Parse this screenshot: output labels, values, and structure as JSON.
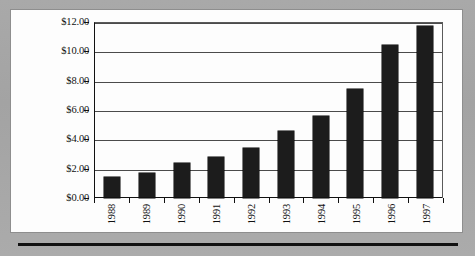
{
  "chart_data": {
    "type": "bar",
    "title": "",
    "xlabel": "",
    "ylabel": "",
    "categories": [
      "1988",
      "1989",
      "1990",
      "1991",
      "1992",
      "1993",
      "1994",
      "1995",
      "1996",
      "1997"
    ],
    "values": [
      1.4,
      1.7,
      2.4,
      2.8,
      3.4,
      4.6,
      5.6,
      7.4,
      10.4,
      11.7
    ],
    "ylim": [
      0,
      12
    ],
    "ytick_values": [
      0,
      2,
      4,
      6,
      8,
      10,
      12
    ],
    "ytick_labels": [
      "$0.00",
      "$2.00",
      "$4.00",
      "$6.00",
      "$8.00",
      "$10.00",
      "$12.00"
    ],
    "grid": true,
    "legend": "none",
    "bar_color": "#1c1c1c",
    "plot_background": "#fdfdfd",
    "axis_color": "#111111",
    "gridline_color": "#4b4b4b"
  },
  "page": {
    "background_color": "#a8a8a8",
    "panel_color": "#fdfdfd",
    "rule_color": "#111111"
  }
}
